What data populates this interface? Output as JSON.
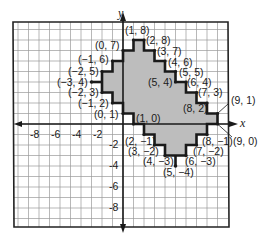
{
  "diagram": {
    "type": "coordinate-grid",
    "axes": {
      "x_label": "x",
      "y_label": "y"
    },
    "x_ticks": [
      "-8",
      "-6",
      "-4",
      "-2"
    ],
    "y_ticks": [
      "-2",
      "-4",
      "-6",
      "-8"
    ],
    "colors": {
      "grid": "#9a9a9a",
      "outline": "#1a1a1a",
      "fill": "#bdbdbd",
      "border": "#222222"
    },
    "points": [
      {
        "label": "(1, 8)"
      },
      {
        "label": "(2, 8)"
      },
      {
        "label": "(0, 7)"
      },
      {
        "label": "(3, 7)"
      },
      {
        "label": "(−1, 6)"
      },
      {
        "label": "(4, 6)"
      },
      {
        "label": "(−2, 5)"
      },
      {
        "label": "(5, 5)"
      },
      {
        "label": "(−3, 4)"
      },
      {
        "label": "(5, 4)"
      },
      {
        "label": "(6, 4)"
      },
      {
        "label": "(−2, 3)"
      },
      {
        "label": "(7, 3)"
      },
      {
        "label": "(−1, 2)"
      },
      {
        "label": "(8, 2)"
      },
      {
        "label": "(0, 1)"
      },
      {
        "label": "(9, 1)"
      },
      {
        "label": "(1, 0)"
      },
      {
        "label": "(9, 0)"
      },
      {
        "label": "(2, −1)"
      },
      {
        "label": "(8, −1)"
      },
      {
        "label": "(3, −2)"
      },
      {
        "label": "(7, −2)"
      },
      {
        "label": "(4, −3)"
      },
      {
        "label": "(6, −3)"
      },
      {
        "label": "(5, −4)"
      }
    ]
  }
}
